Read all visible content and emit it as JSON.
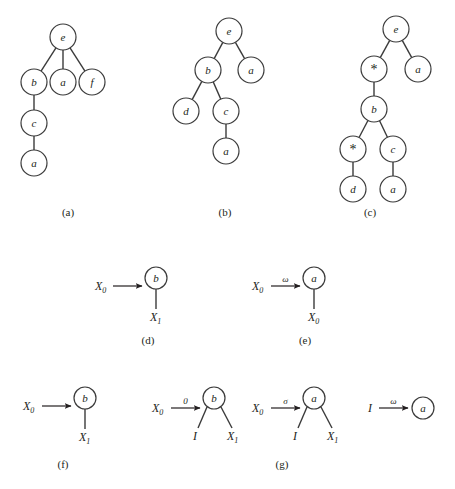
{
  "figure": {
    "background_color": "#ffffff",
    "stroke_color": "#3b3b3b",
    "text_color": "#231f20",
    "captions": [
      {
        "id": "cap-a",
        "text": "(a)",
        "x": 68,
        "y": 216
      },
      {
        "id": "cap-b",
        "text": "(b)",
        "x": 225,
        "y": 216
      },
      {
        "id": "cap-c",
        "text": "(c)",
        "x": 370,
        "y": 216
      },
      {
        "id": "cap-d",
        "text": "(d)",
        "x": 148,
        "y": 344
      },
      {
        "id": "cap-e",
        "text": "(e)",
        "x": 305,
        "y": 344
      },
      {
        "id": "cap-f",
        "text": "(f)",
        "x": 63,
        "y": 468
      },
      {
        "id": "cap-g",
        "text": "(g)",
        "x": 282,
        "y": 468
      }
    ],
    "trees": [
      {
        "id": "tree-a",
        "caption": "(a)",
        "radius": 13,
        "nodes": [
          {
            "id": "a-e",
            "label": "e",
            "style": "italic",
            "x": 63,
            "y": 37
          },
          {
            "id": "a-b",
            "label": "b",
            "style": "italic",
            "x": 34,
            "y": 82
          },
          {
            "id": "a-a1",
            "label": "a",
            "style": "italic",
            "x": 63,
            "y": 82
          },
          {
            "id": "a-f",
            "label": "f",
            "style": "italic",
            "x": 92,
            "y": 82
          },
          {
            "id": "a-c",
            "label": "c",
            "style": "italic",
            "x": 34,
            "y": 123
          },
          {
            "id": "a-a2",
            "label": "a",
            "style": "italic",
            "x": 34,
            "y": 163
          }
        ],
        "edges": [
          [
            "a-e",
            "a-b"
          ],
          [
            "a-e",
            "a-a1"
          ],
          [
            "a-e",
            "a-f"
          ],
          [
            "a-b",
            "a-c"
          ],
          [
            "a-c",
            "a-a2"
          ]
        ]
      },
      {
        "id": "tree-b",
        "caption": "(b)",
        "radius": 13,
        "nodes": [
          {
            "id": "b-e",
            "label": "e",
            "style": "italic",
            "x": 229,
            "y": 31
          },
          {
            "id": "b-b",
            "label": "b",
            "style": "italic",
            "x": 208,
            "y": 70
          },
          {
            "id": "b-a1",
            "label": "a",
            "style": "italic",
            "x": 251,
            "y": 70
          },
          {
            "id": "b-d",
            "label": "d",
            "style": "italic",
            "x": 186,
            "y": 111
          },
          {
            "id": "b-c",
            "label": "c",
            "style": "italic",
            "x": 226,
            "y": 111
          },
          {
            "id": "b-a2",
            "label": "a",
            "style": "italic",
            "x": 226,
            "y": 151
          }
        ],
        "edges": [
          [
            "b-e",
            "b-b"
          ],
          [
            "b-e",
            "b-a1"
          ],
          [
            "b-b",
            "b-d"
          ],
          [
            "b-b",
            "b-c"
          ],
          [
            "b-c",
            "b-a2"
          ]
        ]
      },
      {
        "id": "tree-c",
        "caption": "(c)",
        "radius": 13,
        "nodes": [
          {
            "id": "c-e",
            "label": "e",
            "style": "italic",
            "x": 396,
            "y": 29
          },
          {
            "id": "c-st1",
            "label": "*",
            "style": "op",
            "x": 374,
            "y": 69
          },
          {
            "id": "c-a1",
            "label": "a",
            "style": "italic",
            "x": 418,
            "y": 69
          },
          {
            "id": "c-b",
            "label": "b",
            "style": "italic",
            "x": 374,
            "y": 109
          },
          {
            "id": "c-st2",
            "label": "*",
            "style": "op",
            "x": 353,
            "y": 149
          },
          {
            "id": "c-c",
            "label": "c",
            "style": "italic",
            "x": 393,
            "y": 149
          },
          {
            "id": "c-d",
            "label": "d",
            "style": "italic",
            "x": 353,
            "y": 189
          },
          {
            "id": "c-a2",
            "label": "a",
            "style": "italic",
            "x": 393,
            "y": 189
          }
        ],
        "edges": [
          [
            "c-e",
            "c-st1"
          ],
          [
            "c-e",
            "c-a1"
          ],
          [
            "c-st1",
            "c-b"
          ],
          [
            "c-b",
            "c-st2"
          ],
          [
            "c-b",
            "c-c"
          ],
          [
            "c-st2",
            "c-d"
          ],
          [
            "c-c",
            "c-a2"
          ]
        ]
      }
    ],
    "rules": [
      {
        "id": "rule-d",
        "caption": "(d)",
        "source": {
          "text": "X",
          "sub": "0",
          "x": 95,
          "y": 290
        },
        "arrow": {
          "x1": 113,
          "x2": 142,
          "y": 286,
          "label": ""
        },
        "node": {
          "label": "b",
          "style": "italic",
          "x": 156,
          "y": 278,
          "r": 11
        },
        "stem": {
          "x": 156,
          "y1": 289,
          "y2": 309
        },
        "outputs": [
          {
            "text": "X",
            "sub": "1",
            "x": 150,
            "y": 321
          }
        ]
      },
      {
        "id": "rule-e",
        "caption": "(e)",
        "source": {
          "text": "X",
          "sub": "0",
          "x": 252,
          "y": 290
        },
        "arrow": {
          "x1": 271,
          "x2": 300,
          "y": 286,
          "label": "ω"
        },
        "node": {
          "label": "a",
          "style": "italic",
          "x": 314,
          "y": 278,
          "r": 11
        },
        "stem": {
          "x": 314,
          "y1": 289,
          "y2": 309
        },
        "outputs": [
          {
            "text": "X",
            "sub": "0",
            "x": 308,
            "y": 321
          }
        ]
      },
      {
        "id": "rule-f",
        "caption": "(f)",
        "source": {
          "text": "X",
          "sub": "0",
          "x": 23,
          "y": 410
        },
        "arrow": {
          "x1": 42,
          "x2": 71,
          "y": 406,
          "label": ""
        },
        "node": {
          "label": "b",
          "style": "italic",
          "x": 85,
          "y": 398,
          "r": 11
        },
        "stem": {
          "x": 85,
          "y1": 409,
          "y2": 429
        },
        "outputs": [
          {
            "text": "X",
            "sub": "1",
            "x": 79,
            "y": 441
          }
        ]
      },
      {
        "id": "rule-g1",
        "caption": "(g)",
        "source": {
          "text": "X",
          "sub": "0",
          "x": 152,
          "y": 412
        },
        "arrow": {
          "x1": 171,
          "x2": 200,
          "y": 408,
          "label": "0"
        },
        "node": {
          "label": "b",
          "style": "italic",
          "x": 214,
          "y": 398,
          "r": 11
        },
        "legs": [
          {
            "x1": 207,
            "y1": 407,
            "x2": 198,
            "y2": 428
          },
          {
            "x1": 221,
            "y1": 407,
            "x2": 232,
            "y2": 428
          }
        ],
        "outputs": [
          {
            "text": "I",
            "sub": "",
            "x": 193,
            "y": 440
          },
          {
            "text": "X",
            "sub": "1",
            "x": 227,
            "y": 440
          }
        ]
      },
      {
        "id": "rule-g2",
        "caption": "",
        "source": {
          "text": "X",
          "sub": "0",
          "x": 252,
          "y": 412
        },
        "arrow": {
          "x1": 271,
          "x2": 300,
          "y": 408,
          "label": "σ"
        },
        "node": {
          "label": "a",
          "style": "italic",
          "x": 314,
          "y": 398,
          "r": 11
        },
        "legs": [
          {
            "x1": 307,
            "y1": 407,
            "x2": 298,
            "y2": 428
          },
          {
            "x1": 321,
            "y1": 407,
            "x2": 332,
            "y2": 428
          }
        ],
        "outputs": [
          {
            "text": "I",
            "sub": "",
            "x": 293,
            "y": 440
          },
          {
            "text": "X",
            "sub": "1",
            "x": 327,
            "y": 440
          }
        ]
      },
      {
        "id": "rule-g3",
        "caption": "",
        "source": {
          "text": "I",
          "sub": "",
          "x": 368,
          "y": 412
        },
        "arrow": {
          "x1": 379,
          "x2": 408,
          "y": 408,
          "label": "ω"
        },
        "node": {
          "label": "a",
          "style": "italic",
          "x": 423,
          "y": 408,
          "r": 11
        },
        "legs": [],
        "outputs": []
      }
    ]
  }
}
